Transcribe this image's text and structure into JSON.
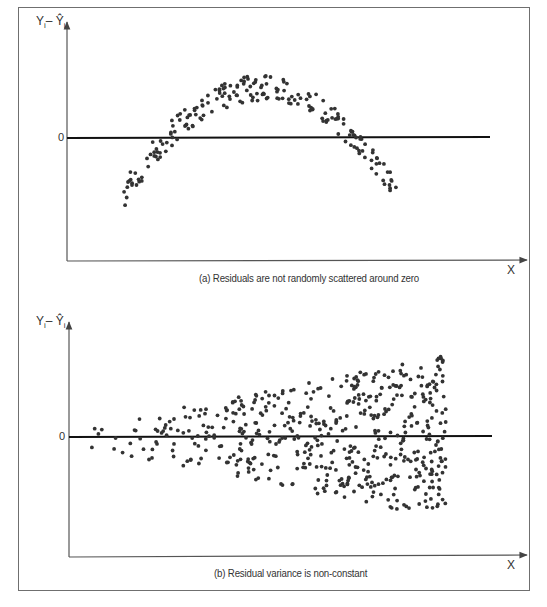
{
  "figure": {
    "panel_a": {
      "caption": "(a) Residuals are not randomly scattered around zero",
      "y_axis_label": "Yᵢ – Ŷᵢ",
      "y_axis_label_main": "Y",
      "y_axis_label_sub": "i",
      "y_axis_label_hat": "– Ŷ",
      "zero_label": "0",
      "x_axis_label": "X"
    },
    "panel_b": {
      "caption": "(b) Residual variance is non-constant",
      "y_axis_label": "Yᵢ – Ŷᵢ",
      "y_axis_label_main": "Y",
      "y_axis_label_sub": "i",
      "y_axis_label_hat": "– Ŷ",
      "zero_label": "0",
      "x_axis_label": "X"
    },
    "colors": {
      "frame": "#6f6f6f",
      "axis": "#555555",
      "zero_line": "#111111",
      "dots": "#333333"
    }
  },
  "chart_data": [
    {
      "type": "scatter",
      "title": "(a) Residuals are not randomly scattered around zero",
      "xlabel": "X",
      "ylabel": "Yi – Ŷi",
      "yticks": [
        "0"
      ],
      "grid": false,
      "legend": null,
      "pattern": "inverted-U (parabolic) residual pattern",
      "pixel_frame": {
        "x_axis_px": 67,
        "zero_y_px": 138,
        "x_axis_y_px": 260,
        "top_y_px": 22,
        "x_end_px": 528,
        "zero_line_end_px": 490
      },
      "shape": {
        "x_start_px": 123,
        "x_end_px": 397,
        "peak_x_px": 262,
        "peak_y_px": 84,
        "end_y_px": 192,
        "band_px": 16
      },
      "n_points": 200,
      "seed": 7
    },
    {
      "type": "scatter",
      "title": "(b) Residual variance is non-constant",
      "xlabel": "X",
      "ylabel": "Yi – Ŷi",
      "yticks": [
        "0"
      ],
      "grid": false,
      "legend": null,
      "pattern": "fan-shaped (heteroscedastic) residuals widening with X",
      "pixel_frame": {
        "x_axis_px": 69,
        "zero_y_px": 437,
        "x_axis_y_px": 556,
        "top_y_px": 322,
        "x_end_px": 528,
        "zero_line_end_px": 492
      },
      "shape": {
        "x_start_px": 74,
        "x_end_px": 446,
        "spread_start_px": 8,
        "spread_end_px": 82
      },
      "n_points": 520,
      "seed": 13
    }
  ]
}
